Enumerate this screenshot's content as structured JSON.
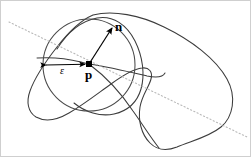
{
  "figure": {
    "kind": "geometry-diagram",
    "background_color": "#ffffff",
    "border_color": "#cfcfcf",
    "curve_color": "#3c3c3c",
    "circle_color": "#4a4a4a",
    "dotted_line_color": "#b9b9b9",
    "point_color": "#000000",
    "arrow_color": "#000000"
  },
  "labels": {
    "normal_vector": "n",
    "point": "p",
    "radius": "ε"
  },
  "geometry": {
    "point_p": {
      "x": 88,
      "y": 63
    },
    "circle": {
      "cx": 88,
      "cy": 64,
      "r": 46
    },
    "normal_arrow": {
      "x1": 88,
      "y1": 63,
      "x2": 112,
      "y2": 25
    },
    "epsilon_arrow": {
      "x1": 42,
      "y1": 64,
      "x2": 87,
      "y2": 63
    },
    "dotted_line": {
      "x1": 8,
      "y1": 21,
      "x2": 246,
      "y2": 136
    }
  },
  "label_positions": {
    "normal_vector": {
      "left": 114,
      "top": 19
    },
    "point": {
      "left": 84,
      "top": 67
    },
    "radius": {
      "left": 59,
      "top": 64
    }
  },
  "elements": {
    "outer_curve_name": "surface-cross-section-curve",
    "inner_curve_name": "surface-fold-curve",
    "circle_name": "epsilon-ball-circle",
    "dotted_name": "tangent-plane-line"
  }
}
